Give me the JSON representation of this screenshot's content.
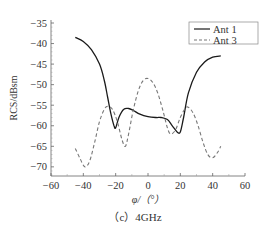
{
  "chart_data": {
    "type": "line",
    "title": "",
    "caption": "（c）4GHz",
    "xlabel": "φ/（°）",
    "ylabel": "RCS/dBsm",
    "xlim": [
      -60,
      60
    ],
    "ylim": [
      -72,
      -35
    ],
    "xticks": [
      -60,
      -40,
      -20,
      0,
      20,
      40,
      60
    ],
    "yticks": [
      -35,
      -40,
      -45,
      -50,
      -55,
      -60,
      -65,
      -70
    ],
    "grid": false,
    "legend_position": "upper right",
    "series": [
      {
        "name": "Ant 1",
        "style": "solid",
        "color": "#1a1a1a",
        "x": [
          -45,
          -40,
          -35,
          -30,
          -27,
          -25,
          -23,
          -21,
          -20,
          -18,
          -15,
          -12,
          -9,
          -5,
          0,
          5,
          8,
          12,
          15,
          18,
          20,
          22,
          25,
          30,
          35,
          40,
          45
        ],
        "y": [
          -38.5,
          -39.5,
          -41.5,
          -45,
          -49,
          -53,
          -57,
          -60,
          -60.5,
          -58,
          -56,
          -55.8,
          -56.3,
          -57.2,
          -57.8,
          -58,
          -58,
          -58.5,
          -60,
          -61.5,
          -61.5,
          -58,
          -52,
          -47,
          -44.5,
          -43.3,
          -43
        ]
      },
      {
        "name": "Ant 3",
        "style": "dashed",
        "color": "#777777",
        "x": [
          -45,
          -42,
          -39,
          -36,
          -33,
          -30,
          -27,
          -25,
          -22,
          -19,
          -16,
          -14,
          -12,
          -9,
          -6,
          -3,
          0,
          3,
          6,
          9,
          12,
          14,
          17,
          20,
          23,
          25,
          28,
          31,
          34,
          37,
          40,
          43,
          45
        ],
        "y": [
          -65.5,
          -68,
          -70,
          -68.5,
          -64,
          -59,
          -56,
          -55.3,
          -56,
          -59,
          -63.5,
          -65,
          -62,
          -56,
          -51.5,
          -49,
          -48.5,
          -49.5,
          -52,
          -56,
          -60.5,
          -62,
          -61,
          -58,
          -55.8,
          -55.5,
          -57,
          -60,
          -64,
          -67,
          -67.8,
          -66.5,
          -65
        ]
      }
    ]
  }
}
